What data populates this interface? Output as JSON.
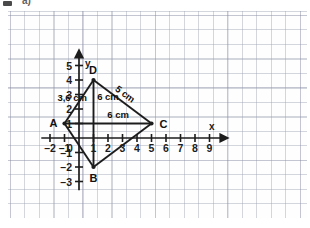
{
  "header": {
    "bullet_icon": "square-bullet-icon",
    "label": "a)"
  },
  "chart_data": {
    "type": "scatter",
    "title": "",
    "xlabel": "x",
    "ylabel": "y",
    "xlim": [
      -2.6,
      9.8
    ],
    "ylim": [
      -3.6,
      5.6
    ],
    "grid": true,
    "grid_step": 1,
    "legend": "none",
    "x_ticks": [
      -2,
      -1,
      0,
      1,
      2,
      3,
      4,
      5,
      6,
      7,
      8,
      9
    ],
    "x_tick_labels": [
      "-2",
      "-1",
      "0",
      "1",
      "2",
      "3",
      "4",
      "5",
      "6",
      "7",
      "8",
      "9"
    ],
    "y_ticks": [
      -3,
      -2,
      -1,
      1,
      2,
      3,
      4,
      5
    ],
    "y_tick_labels": [
      "-3",
      "-2",
      "-1",
      "1",
      "2",
      "3",
      "4",
      "5"
    ],
    "origin_label": "0",
    "points": [
      {
        "name": "A",
        "label": "A",
        "x": -1,
        "y": 1,
        "label_pos": "left"
      },
      {
        "name": "B",
        "label": "B",
        "x": 1,
        "y": -2,
        "label_pos": "below"
      },
      {
        "name": "C",
        "label": "C",
        "x": 5,
        "y": 1,
        "label_pos": "right"
      },
      {
        "name": "D",
        "label": "D",
        "x": 1,
        "y": 4,
        "label_pos": "above"
      }
    ],
    "polygon": [
      "A",
      "D",
      "C",
      "B"
    ],
    "segments": [
      {
        "from": "A",
        "to": "D"
      },
      {
        "from": "D",
        "to": "C"
      },
      {
        "from": "C",
        "to": "B"
      },
      {
        "from": "B",
        "to": "A"
      },
      {
        "from": "D",
        "to": "B"
      },
      {
        "from": "A",
        "to": "C"
      }
    ],
    "annotations": [
      {
        "name": "segment-ad-length",
        "text": "3,6 cm",
        "x": 0.55,
        "y": 2.55,
        "rotation": 0,
        "anchor": "end"
      },
      {
        "name": "segment-db-length",
        "text": "6 cm",
        "x": 1.25,
        "y": 2.6,
        "rotation": 0,
        "anchor": "start"
      },
      {
        "name": "segment-ac-length",
        "text": "6 cm",
        "x": 1.95,
        "y": 1.35,
        "rotation": 0,
        "anchor": "start"
      },
      {
        "name": "segment-dc-length",
        "text": "5 cm",
        "x": 3.05,
        "y": 2.85,
        "rotation": 37,
        "anchor": "middle"
      }
    ]
  }
}
